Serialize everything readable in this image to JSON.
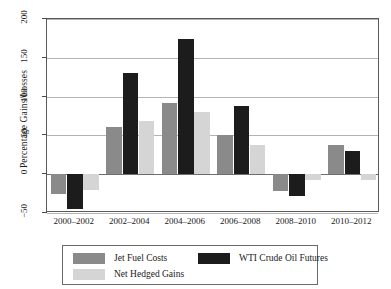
{
  "chart_data": {
    "type": "bar",
    "title": "",
    "xlabel": "",
    "ylabel": "Percentage Gains/Losses",
    "categories": [
      "2000–2002",
      "2002–2004",
      "2004–2006",
      "2006–2008",
      "2008–2010",
      "2010–2012"
    ],
    "series": [
      {
        "name": "Jet Fuel Costs",
        "color": "#8a8a8a",
        "values": [
          -25,
          61,
          92,
          50,
          -22,
          38
        ]
      },
      {
        "name": "WTI Crude Oil Futures",
        "color": "#1c1c1c",
        "values": [
          -45,
          131,
          174,
          88,
          -28,
          30
        ]
      },
      {
        "name": "Net Hedged Gains",
        "color": "#d5d5d5",
        "values": [
          -20,
          69,
          80,
          37,
          -8,
          -8
        ]
      }
    ],
    "ylim": [
      -50,
      200
    ],
    "yticks": [
      -50,
      0,
      50,
      100,
      150,
      200
    ],
    "ytick_labels": [
      "−50",
      "0",
      "50",
      "100",
      "150",
      "200"
    ],
    "grid": true,
    "legend_position": "bottom",
    "legend_order": [
      "Jet Fuel Costs",
      "WTI Crude Oil Futures",
      "Net Hedged Gains"
    ]
  }
}
